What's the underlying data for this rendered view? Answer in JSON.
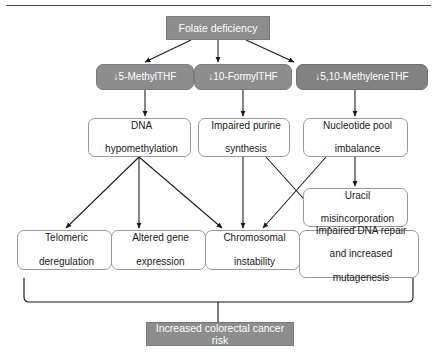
{
  "diagram": {
    "title_bar": {
      "label": "Folate deficiency"
    },
    "metabolites": [
      {
        "label": "↓5-MethylTHF"
      },
      {
        "label": "↓10-FormylTHF"
      },
      {
        "label": "↓5,10-MethyleneTHF"
      }
    ],
    "mechanisms": [
      {
        "line1": "DNA",
        "line2": "hypomethylation"
      },
      {
        "line1": "Impaired purine",
        "line2": "synthesis"
      },
      {
        "line1": "Nucleotide pool",
        "line2": "imbalance"
      }
    ],
    "intermediate": {
      "line1": "Uracil",
      "line2": "misincorporation"
    },
    "outcomes": [
      {
        "line1": "Telomeric",
        "line2": "deregulation",
        "line3": ""
      },
      {
        "line1": "Altered gene",
        "line2": "expression",
        "line3": ""
      },
      {
        "line1": "Chromosomal",
        "line2": "instability",
        "line3": ""
      },
      {
        "line1": "Impaired DNA repair",
        "line2": "and increased",
        "line3": "mutagenesis"
      }
    ],
    "result_bar": {
      "label": "Increased colorectal cancer risk"
    },
    "colors": {
      "bar_fill": "#8d8d8d",
      "chip_fill": "#8d8d8d",
      "box_stroke": "#9a9a9a",
      "connector": "#1a1a1a",
      "bar_text": "#ffffff",
      "box_text": "#1a1a1a"
    }
  }
}
